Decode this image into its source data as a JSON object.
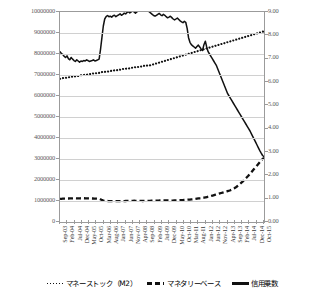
{
  "chart_data": {
    "type": "line",
    "title": "",
    "xlabel": "",
    "ylabel_left": "",
    "ylabel_right": "",
    "grid": true,
    "legend_position": "bottom",
    "ylim_left": [
      0,
      10000000
    ],
    "ylim_right": [
      0.0,
      9.0
    ],
    "yticks_left": [
      "0",
      "1000000",
      "2000000",
      "3000000",
      "4000000",
      "5000000",
      "6000000",
      "7000000",
      "8000000",
      "9000000",
      "10000000"
    ],
    "yticks_right": [
      "0.00",
      "1.00",
      "2.00",
      "3.00",
      "4.00",
      "5.00",
      "6.00",
      "7.00",
      "8.00",
      "9.00"
    ],
    "xticks": [
      "Sep-03",
      "Feb-04",
      "Jul-04",
      "Dec-04",
      "May-05",
      "Oct-05",
      "Mar-06",
      "Aug-06",
      "Jan-07",
      "Jun-07",
      "Nov-07",
      "Apr-08",
      "Sep-08",
      "Feb-09",
      "Jul-09",
      "Dec-09",
      "May-10",
      "Oct-10",
      "Mar-11",
      "Aug-11",
      "Jan-12",
      "Jun-12",
      "Nov-12",
      "Apr-13",
      "Sep-13",
      "Feb-14",
      "Jul-14",
      "Dec-14",
      "Oct-15"
    ],
    "series": [
      {
        "name": "マネーストック（M2）",
        "axis": "left",
        "style": "dotted",
        "values": [
          6820000,
          6840000,
          6850000,
          6870000,
          6860000,
          6880000,
          6900000,
          6890000,
          6910000,
          6930000,
          6920000,
          6940000,
          6960000,
          6950000,
          6970000,
          6990000,
          6980000,
          7000000,
          7020000,
          7010000,
          7030000,
          7050000,
          7040000,
          7060000,
          7080000,
          7070000,
          7090000,
          7110000,
          7100000,
          7120000,
          7140000,
          7130000,
          7150000,
          7170000,
          7160000,
          7180000,
          7200000,
          7190000,
          7210000,
          7230000,
          7220000,
          7240000,
          7260000,
          7250000,
          7270000,
          7290000,
          7280000,
          7300000,
          7320000,
          7310000,
          7330000,
          7350000,
          7340000,
          7360000,
          7380000,
          7370000,
          7390000,
          7410000,
          7400000,
          7420000,
          7440000,
          7430000,
          7450000,
          7470000,
          7460000,
          7480000,
          7500000,
          7520000,
          7540000,
          7560000,
          7580000,
          7600000,
          7620000,
          7640000,
          7660000,
          7680000,
          7700000,
          7720000,
          7740000,
          7760000,
          7780000,
          7800000,
          7820000,
          7840000,
          7860000,
          7880000,
          7900000,
          7920000,
          7940000,
          7960000,
          7980000,
          8000000,
          8020000,
          8040000,
          8060000,
          8080000,
          8100000,
          8120000,
          8140000,
          8160000,
          8180000,
          8200000,
          8220000,
          8240000,
          8260000,
          8280000,
          8300000,
          8320000,
          8340000,
          8360000,
          8380000,
          8400000,
          8420000,
          8440000,
          8460000,
          8480000,
          8500000,
          8520000,
          8540000,
          8560000,
          8580000,
          8600000,
          8620000,
          8640000,
          8660000,
          8680000,
          8700000,
          8720000,
          8740000,
          8760000,
          8780000,
          8800000,
          8820000,
          8840000,
          8860000,
          8880000,
          8900000,
          8920000,
          8940000,
          8960000,
          8980000,
          9000000,
          9020000,
          9040000,
          9060000,
          9080000
        ],
        "note": "right-axis equivalent display 6.0 → 8.1; plotted as dotted marker line"
      },
      {
        "name": "マネタリーベース",
        "axis": "left",
        "style": "dashed",
        "values": [
          1100000,
          1105000,
          1110000,
          1115000,
          1112000,
          1118000,
          1120000,
          1122000,
          1125000,
          1128000,
          1130000,
          1126000,
          1124000,
          1127000,
          1129000,
          1131000,
          1133000,
          1130000,
          1128000,
          1126000,
          1124000,
          1122000,
          1120000,
          1118000,
          1116000,
          1112000,
          1108000,
          1104000,
          1100000,
          1060000,
          1030000,
          1010000,
          1005000,
          1000000,
          998000,
          996000,
          995000,
          994000,
          993000,
          992000,
          991000,
          990000,
          992000,
          994000,
          996000,
          998000,
          1000000,
          1002000,
          1004000,
          1006000,
          1008000,
          1010000,
          1012000,
          1010000,
          1008000,
          1006000,
          1004000,
          1002000,
          1000000,
          1002000,
          1004000,
          1006000,
          1008000,
          1010000,
          1012000,
          1014000,
          1016000,
          1018000,
          1020000,
          1022000,
          1024000,
          1026000,
          1028000,
          1030000,
          1028000,
          1026000,
          1024000,
          1022000,
          1020000,
          1022000,
          1024000,
          1026000,
          1028000,
          1030000,
          1035000,
          1040000,
          1045000,
          1050000,
          1055000,
          1060000,
          1065000,
          1070000,
          1075000,
          1080000,
          1090000,
          1100000,
          1110000,
          1120000,
          1130000,
          1140000,
          1150000,
          1160000,
          1175000,
          1190000,
          1205000,
          1220000,
          1240000,
          1260000,
          1280000,
          1300000,
          1320000,
          1340000,
          1360000,
          1380000,
          1400000,
          1420000,
          1440000,
          1460000,
          1480000,
          1500000,
          1530000,
          1560000,
          1600000,
          1640000,
          1690000,
          1740000,
          1800000,
          1860000,
          1920000,
          1990000,
          2060000,
          2130000,
          2200000,
          2280000,
          2360000,
          2440000,
          2520000,
          2600000,
          2680000,
          2760000,
          2840000,
          2920000,
          3000000,
          3060000
        ]
      },
      {
        "name": "信用乗数",
        "axis": "right",
        "style": "solid",
        "values": [
          7.3,
          7.22,
          7.18,
          7.1,
          7.05,
          7.12,
          7.0,
          6.95,
          7.05,
          6.98,
          6.92,
          6.88,
          6.95,
          6.9,
          6.85,
          6.9,
          6.88,
          6.92,
          6.9,
          6.95,
          6.92,
          6.88,
          6.9,
          6.92,
          6.95,
          6.9,
          6.92,
          6.95,
          6.98,
          7.4,
          7.9,
          8.4,
          8.7,
          8.8,
          8.85,
          8.8,
          8.82,
          8.78,
          8.84,
          8.86,
          8.8,
          8.84,
          8.88,
          8.92,
          8.86,
          8.9,
          8.95,
          8.92,
          8.98,
          9.02,
          8.96,
          9.0,
          9.05,
          9.0,
          8.95,
          9.0,
          9.05,
          9.1,
          9.14,
          9.18,
          9.2,
          9.15,
          9.1,
          9.05,
          9.0,
          8.95,
          8.9,
          8.85,
          8.82,
          8.86,
          8.9,
          8.94,
          8.88,
          8.84,
          8.9,
          8.86,
          8.8,
          8.75,
          8.78,
          8.82,
          8.76,
          8.7,
          8.66,
          8.7,
          8.74,
          8.68,
          8.62,
          8.58,
          8.54,
          8.6,
          8.56,
          8.3,
          7.9,
          7.7,
          7.6,
          7.55,
          7.5,
          7.45,
          7.52,
          7.58,
          7.5,
          7.42,
          7.35,
          7.6,
          7.75,
          7.5,
          7.3,
          7.2,
          7.1,
          7.0,
          6.9,
          6.8,
          6.7,
          6.55,
          6.4,
          6.25,
          6.1,
          5.95,
          5.8,
          5.65,
          5.5,
          5.4,
          5.3,
          5.2,
          5.1,
          5.0,
          4.9,
          4.8,
          4.7,
          4.6,
          4.5,
          4.4,
          4.3,
          4.2,
          4.1,
          4.0,
          3.9,
          3.78,
          3.66,
          3.54,
          3.42,
          3.3,
          3.18,
          3.06,
          2.95,
          2.85,
          2.8
        ]
      }
    ]
  }
}
